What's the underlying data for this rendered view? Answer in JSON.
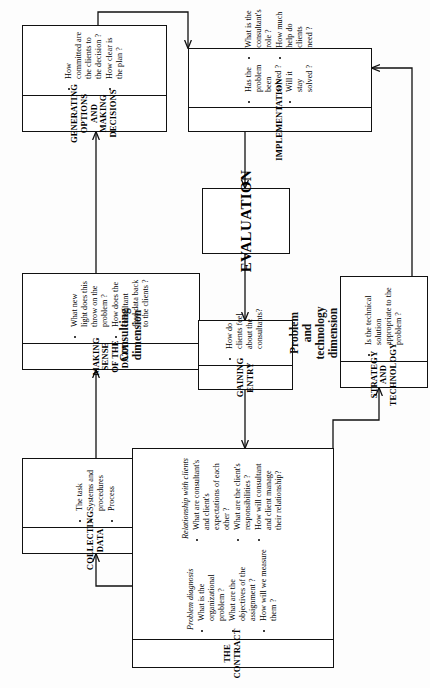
{
  "diagram": {
    "orientation": "rotated-90-ccw",
    "dimension_labels": [
      {
        "id": "consulting",
        "text": "Consulting\ndimension",
        "line1": "Consulting",
        "line2": "dimension"
      },
      {
        "id": "problem_tech",
        "text": "Problem and technology dimension",
        "line1": "Problem",
        "line2": "and",
        "line3": "technology",
        "line4": "dimension"
      }
    ],
    "nodes": [
      {
        "id": "collecting_data",
        "title": "COLLECTING DATA",
        "columns": [
          {
            "subtitle": "",
            "bullets": [
              "The task",
              "Systems and procedures",
              "Process"
            ]
          }
        ]
      },
      {
        "id": "making_sense",
        "title": "MAKING SENSE OF THE DATA",
        "columns": [
          {
            "subtitle": "",
            "bullets": [
              "What new light does this throw on the problem ?",
              "How does the consultant feed data back to the clients ?"
            ]
          }
        ]
      },
      {
        "id": "generating_options",
        "title": "GENERATING OPTIONS AND MAKING DECISIONS",
        "title_line1": "GENERATING OPTIONS",
        "title_line2": "AND MAKING DECISIONS",
        "columns": [
          {
            "subtitle": "",
            "bullets": [
              "How committed are the clients to the decision ?",
              "How clear is the plan ?"
            ]
          }
        ]
      },
      {
        "id": "the_contract",
        "title": "THE CONTRACT",
        "columns": [
          {
            "subtitle": "Problem diagnosis",
            "bullets": [
              "What is the organizational problem ?",
              "What are the objectives of the assignment ?",
              "How will we measure them ?"
            ]
          },
          {
            "subtitle": "Relationship with clients",
            "bullets": [
              "What are consultant's and client's expectations of each other ?",
              "What are the client's responsibilities ?",
              "How will consultant and client manage their relationship?"
            ]
          }
        ]
      },
      {
        "id": "gaining_entry",
        "title": "GAINING ENTRY",
        "columns": [
          {
            "subtitle": "",
            "bullets": [
              "How do clients feel about the consultants?"
            ]
          }
        ]
      },
      {
        "id": "evaluation",
        "title": "EVALUATION",
        "plain": true,
        "columns": []
      },
      {
        "id": "implementation",
        "title": "IMPLEMENTATION",
        "columns": [
          {
            "subtitle": "",
            "bullets": [
              "Has the problem been solved ?",
              "Will it stay solved ?"
            ]
          },
          {
            "subtitle": "",
            "bullets": [
              "What is the consultant's role ?",
              "How much help do clients need ?"
            ]
          }
        ]
      },
      {
        "id": "strategy_technology",
        "title": "STRATEGY AND TECHNOLOGY",
        "columns": [
          {
            "subtitle": "",
            "bullets": [
              "Is the technical solution appropriate to the problem ?"
            ]
          }
        ]
      }
    ],
    "edges": [
      {
        "from": "the_contract",
        "to": "collecting_data"
      },
      {
        "from": "collecting_data",
        "to": "making_sense"
      },
      {
        "from": "making_sense",
        "to": "generating_options"
      },
      {
        "from": "generating_options",
        "to": "implementation"
      },
      {
        "from": "implementation",
        "to": "evaluation"
      },
      {
        "from": "evaluation",
        "to": "gaining_entry"
      },
      {
        "from": "gaining_entry",
        "to": "the_contract"
      },
      {
        "from": "the_contract",
        "to": "strategy_technology"
      },
      {
        "from": "strategy_technology",
        "to": "implementation"
      }
    ],
    "colors": {
      "stroke": "#111111",
      "background": "#ffffff"
    }
  }
}
